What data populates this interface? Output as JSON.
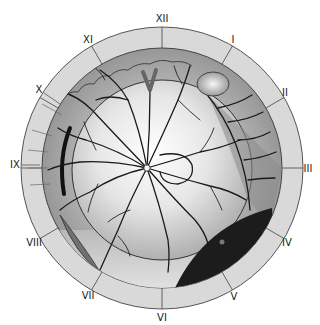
{
  "diagram": {
    "type": "retinal-fundus-clock-chart",
    "clock_hours": [
      {
        "label": "XII",
        "x": 162,
        "y": 19
      },
      {
        "label": "I",
        "x": 233,
        "y": 40
      },
      {
        "label": "II",
        "x": 285,
        "y": 93
      },
      {
        "label": "III",
        "x": 308,
        "y": 169
      },
      {
        "label": "IV",
        "x": 287,
        "y": 243
      },
      {
        "label": "V",
        "x": 234,
        "y": 297
      },
      {
        "label": "VI",
        "x": 162,
        "y": 318
      },
      {
        "label": "VII",
        "x": 88,
        "y": 296
      },
      {
        "label": "VIII",
        "x": 34,
        "y": 243
      },
      {
        "label": "IX",
        "x": 15,
        "y": 165
      },
      {
        "label": "X",
        "x": 39,
        "y": 90
      },
      {
        "label": "XI",
        "x": 88,
        "y": 40
      }
    ],
    "features": {
      "optic_disc": "optic-disc",
      "lattice_lesion": "lattice-degeneration",
      "retinal_tear": "horseshoe-tear",
      "detachment_region": "retinal-detachment",
      "dark_lesion": "pigmented-lesion",
      "elevated_lesion": "elevated-lesion",
      "cluster_lesions": "round-lesion-cluster"
    },
    "colors": {
      "outer_ring": "#d6d6d6",
      "peripheral_retina": "#9a9a9a",
      "posterior_pole_light": "#f2f2f2",
      "dark_lesion": "#1c1c1c",
      "vessel": "#1a1a1a"
    }
  }
}
